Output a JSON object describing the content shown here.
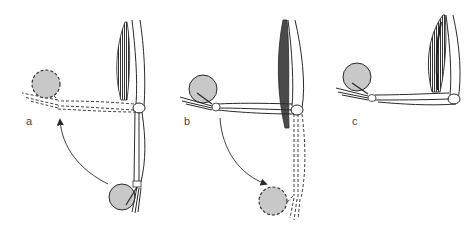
{
  "figure": {
    "panels": [
      {
        "label": "a",
        "state": "forearm extended down (solid), moving up to horizontal (dashed)",
        "arrow": "up"
      },
      {
        "label": "b",
        "state": "forearm horizontal (solid), moving down to extended (dashed)",
        "arrow": "down"
      },
      {
        "label": "c",
        "state": "forearm held horizontal, biceps contracted",
        "arrow": "none"
      }
    ]
  },
  "colors": {
    "line": "#2a2a2a",
    "ball_fill": "#c8c8c8",
    "muscle_fill": "#555555",
    "label": "#444444"
  }
}
